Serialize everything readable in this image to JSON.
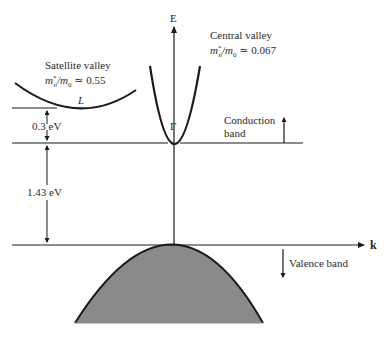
{
  "diagram": {
    "axes": {
      "energy_label": "E",
      "wavevector_label": "k"
    },
    "central_valley": {
      "title": "Central valley",
      "mass_ratio": "m*n/m0 ≃ 0.067",
      "mass_lhs": "m",
      "mass_sup": "*",
      "mass_sub": "n",
      "mass_mid": "/m",
      "mass_sub0": "0",
      "mass_rhs": " ≃ 0.067",
      "point_label": "Γ"
    },
    "satellite_valley": {
      "title": "Satellite valley",
      "mass_ratio": "m*n/m0 ≃ 0.55",
      "mass_lhs": "m",
      "mass_sup": "*",
      "mass_sub": "n",
      "mass_mid": "/m",
      "mass_sub0": "0",
      "mass_rhs": " ≃ 0.55",
      "point_label": "L"
    },
    "energy_gaps": {
      "satellite_offset": "0.3 eV",
      "band_gap": "1.43 eV"
    },
    "bands": {
      "conduction_label_1": "Conduction",
      "conduction_label_2": "band",
      "valence_label": "Valence band"
    },
    "colors": {
      "line": "#1a1a1a",
      "valence_fill": "#8a8a8a",
      "text": "#2a2a2a"
    }
  }
}
